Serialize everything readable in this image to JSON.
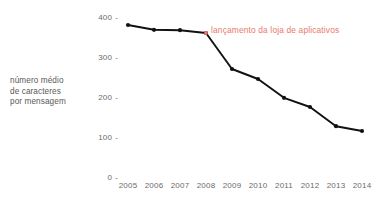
{
  "chart_data": {
    "type": "line",
    "title": "",
    "xlabel": "",
    "ylabel": "número médio de caracteres por mensagem",
    "ylabel_lines": [
      "número médio",
      "de caracteres",
      "por mensagem"
    ],
    "categories": [
      "2005",
      "2006",
      "2007",
      "2008",
      "2009",
      "2010",
      "2011",
      "2012",
      "2013",
      "2014"
    ],
    "x": [
      2005,
      2006,
      2007,
      2008,
      2009,
      2010,
      2011,
      2012,
      2013,
      2014
    ],
    "values": [
      380,
      368,
      367,
      360,
      270,
      245,
      198,
      175,
      127,
      115
    ],
    "ytick_labels": [
      "400",
      "300",
      "200",
      "100",
      "0"
    ],
    "ytick_values": [
      400,
      300,
      200,
      100,
      0
    ],
    "ylim": [
      0,
      420
    ],
    "xlim": [
      2004.5,
      2014.5
    ],
    "grid": false,
    "legend": null,
    "markers": true,
    "series": [
      {
        "name": "número médio de caracteres por mensagem",
        "values": [
          380,
          368,
          367,
          360,
          270,
          245,
          198,
          175,
          127,
          115
        ],
        "color": "#111111"
      }
    ],
    "annotations": [
      {
        "text": "lançamento da loja de aplicativos",
        "at_x": 2008,
        "at_y": 360,
        "color": "#e8796c",
        "marker": "dot"
      }
    ],
    "colors": {
      "line": "#111111",
      "marker": "#111111",
      "annotation": "#e8796c",
      "annotation_marker": "#e8796c",
      "tick_label": "#6b6b6b",
      "axis_title": "#595959",
      "background": "#ffffff"
    },
    "tick_dash": "-"
  }
}
